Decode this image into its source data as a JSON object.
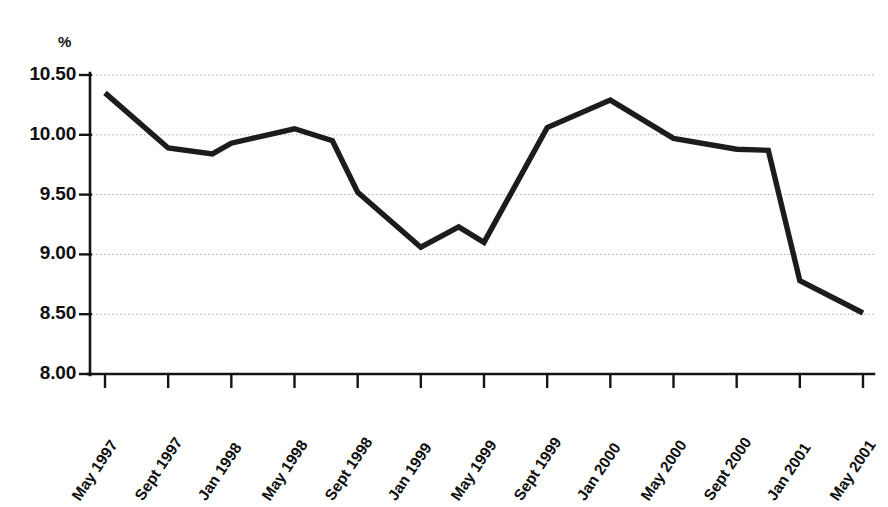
{
  "chart_data": {
    "type": "line",
    "title": "",
    "subtitle": "",
    "xlabel": "",
    "ylabel": "%",
    "y_unit_label": "%",
    "categories": [
      "May 1997",
      "Sept 1997",
      "Jan 1998",
      "May 1998",
      "Sept 1998",
      "Jan 1999",
      "May 1999",
      "Sept 1999",
      "Jan 2000",
      "May 2000",
      "Sept 2000",
      "Jan 2001",
      "May 2001"
    ],
    "x": [
      "May 1997",
      "Sept 1997",
      "Jan 1998",
      "May 1998",
      "Sept 1998",
      "Jan 1999",
      "May 1999",
      "Sept 1999",
      "Jan 2000",
      "May 2000",
      "Sept 2000",
      "Jan 2001",
      "May 2001"
    ],
    "values": [
      10.35,
      9.89,
      9.93,
      10.05,
      9.52,
      9.06,
      9.1,
      10.06,
      10.29,
      9.97,
      9.88,
      8.78,
      8.51
    ],
    "series": [
      {
        "name": "rate",
        "values": [
          10.35,
          9.89,
          9.93,
          10.05,
          9.52,
          9.06,
          9.1,
          10.06,
          10.29,
          9.97,
          9.88,
          8.78,
          8.51
        ]
      }
    ],
    "intermediate_vertices": [
      {
        "x_index": 1.7,
        "value": 9.84
      },
      {
        "x_index": 3.6,
        "value": 9.95
      },
      {
        "x_index": 5.6,
        "value": 9.23
      },
      {
        "x_index": 10.5,
        "value": 9.87
      }
    ],
    "ylim": [
      8.0,
      10.5
    ],
    "ytick_values": [
      10.5,
      10.0,
      9.5,
      9.0,
      8.5,
      8.0
    ],
    "ytick_labels": [
      "10.50",
      "10.00",
      "9.50",
      "9.00",
      "8.50",
      "8.00"
    ],
    "grid": true,
    "grid_axis": "y",
    "legend": false,
    "legend_position": "none",
    "line_color": "#1c1c1c",
    "grid_color": "#9a9a9a",
    "axis_color": "#141414",
    "background_color": "#ffffff",
    "xtick_rotation_degrees": -56
  }
}
